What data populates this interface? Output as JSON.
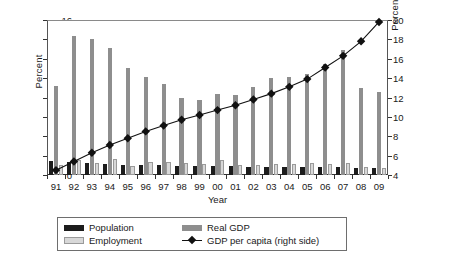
{
  "chart_data": {
    "type": "bar",
    "title": "",
    "xlabel": "Year",
    "ylabel": "Percent",
    "ylabel_right": "Percentage of EU-15 (PPP)",
    "categories": [
      "91",
      "92",
      "93",
      "94",
      "95",
      "96",
      "97",
      "98",
      "99",
      "00",
      "01",
      "02",
      "03",
      "04",
      "05",
      "06",
      "07",
      "08",
      "09"
    ],
    "ylim": [
      0,
      16
    ],
    "yticks": [
      0,
      2,
      4,
      6,
      8,
      10,
      12,
      14,
      16
    ],
    "ylim_right": [
      4,
      20
    ],
    "yticks_right": [
      4,
      6,
      8,
      10,
      12,
      14,
      16,
      18,
      20
    ],
    "grid": false,
    "legend_position": "bottom",
    "series": [
      {
        "name": "Population",
        "axis": "left",
        "color": "#1c1c1c",
        "values": [
          1.45,
          1.35,
          1.2,
          1.1,
          1.05,
          1.05,
          1.0,
          0.95,
          0.95,
          0.9,
          0.9,
          0.85,
          0.85,
          0.85,
          0.8,
          0.8,
          0.8,
          0.75,
          0.75
        ]
      },
      {
        "name": "Real GDP",
        "axis": "left",
        "color": "#8e8e8e",
        "values": [
          9.2,
          14.3,
          14.0,
          13.1,
          11.0,
          10.1,
          9.35,
          7.9,
          7.7,
          8.4,
          8.3,
          9.1,
          10.0,
          10.1,
          10.4,
          11.5,
          12.9,
          9.0,
          8.6
        ]
      },
      {
        "name": "Employment",
        "axis": "left",
        "color": "#d8d8d8",
        "values": [
          1.0,
          1.5,
          1.2,
          1.7,
          0.95,
          1.35,
          1.35,
          1.2,
          1.1,
          1.5,
          1.0,
          1.0,
          1.1,
          1.1,
          1.2,
          1.15,
          1.2,
          0.85,
          0.7
        ]
      },
      {
        "name": "GDP per capita (right side)",
        "axis": "right",
        "color": "#111111",
        "marker": "diamond",
        "values": [
          4.5,
          5.4,
          6.3,
          7.1,
          7.8,
          8.5,
          9.1,
          9.7,
          10.2,
          10.7,
          11.2,
          11.8,
          12.4,
          13.1,
          13.9,
          15.1,
          16.3,
          17.8,
          19.8
        ]
      }
    ]
  },
  "legend": {
    "population_label": "Population",
    "real_gdp_label": "Real GDP",
    "employment_label": "Employment",
    "gdp_per_capita_label": "GDP per capita (right side)"
  }
}
